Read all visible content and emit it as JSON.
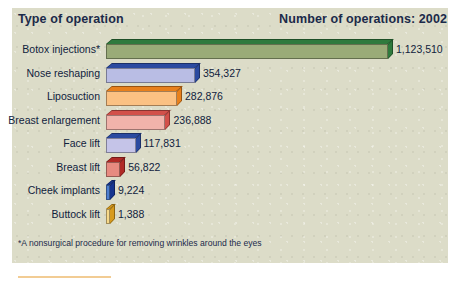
{
  "header": {
    "left_title": "Type of operation",
    "right_title": "Number of operations: 2002"
  },
  "footnote": "*A nonsurgical procedure for removing wrinkles around the eyes",
  "colors": {
    "panel_background": "#dcdcc8",
    "text": "#10223d",
    "header_text": "#1b2a4a",
    "accent_rule": "#e8a33d"
  },
  "chart_data": {
    "type": "bar",
    "orientation": "horizontal",
    "title": "Number of operations: 2002",
    "xlabel": "Number of operations",
    "ylabel": "Type of operation",
    "grid": false,
    "legend": null,
    "xlim": [
      0,
      1123510
    ],
    "categories": [
      "Botox injections*",
      "Nose reshaping",
      "Liposuction",
      "Breast enlargement",
      "Face lift",
      "Breast lift",
      "Cheek implants",
      "Buttock lift"
    ],
    "values": [
      1123510,
      354327,
      282876,
      236888,
      117831,
      56822,
      9224,
      1388
    ],
    "value_labels": [
      "1,123,510",
      "354,327",
      "282,876",
      "236,888",
      "117,831",
      "56,822",
      "9,224",
      "1,388"
    ],
    "bars": [
      {
        "label": "Botox injections*",
        "value": 1123510,
        "value_label": "1,123,510",
        "front": "#9aab78",
        "top": "#2f7a3d",
        "side": "#2f7a3d"
      },
      {
        "label": "Nose reshaping",
        "value": 354327,
        "value_label": "354,327",
        "front": "#b9bde4",
        "top": "#2b4aa0",
        "side": "#2b4aa0"
      },
      {
        "label": "Liposuction",
        "value": 282876,
        "value_label": "282,876",
        "front": "#fbc183",
        "top": "#e8801c",
        "side": "#e8801c"
      },
      {
        "label": "Breast enlargement",
        "value": 236888,
        "value_label": "236,888",
        "front": "#f1b3ab",
        "top": "#d2504a",
        "side": "#d2504a"
      },
      {
        "label": "Face lift",
        "value": 117831,
        "value_label": "117,831",
        "front": "#c5c4e8",
        "top": "#2b4aa0",
        "side": "#2b4aa0"
      },
      {
        "label": "Breast lift",
        "value": 56822,
        "value_label": "56,822",
        "front": "#e78a80",
        "top": "#b02a26",
        "side": "#b02a26"
      },
      {
        "label": "Cheek implants",
        "value": 9224,
        "value_label": "9,224",
        "front": "#4e7fd0",
        "top": "#16348f",
        "side": "#16348f"
      },
      {
        "label": "Buttock lift",
        "value": 1388,
        "value_label": "1,388",
        "front": "#f7d98a",
        "top": "#d79a1c",
        "side": "#d79a1c"
      }
    ]
  }
}
